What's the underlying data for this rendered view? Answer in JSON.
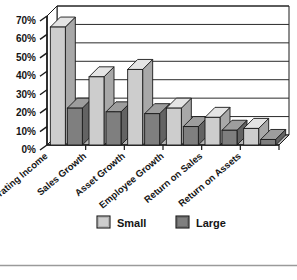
{
  "chart_data": {
    "type": "bar",
    "title": "",
    "subtitle": "",
    "xlabel": "",
    "ylabel": "",
    "categories": [
      "Operating Income",
      "Sales Growth",
      "Asset Growth",
      "Employee Growth",
      "Return on Sales",
      "Return on Assets"
    ],
    "series": [
      {
        "name": "Small",
        "color": "#cdcdcd",
        "values": [
          64,
          37,
          41,
          20,
          15,
          9
        ]
      },
      {
        "name": "Large",
        "color": "#7f7f7f",
        "values": [
          20,
          18,
          17,
          10,
          8,
          3
        ]
      }
    ],
    "ylim": [
      0,
      70
    ],
    "ytick_values": [
      0,
      10,
      20,
      30,
      40,
      50,
      60,
      70
    ],
    "ytick_labels": [
      "0%",
      "10%",
      "20%",
      "30%",
      "40%",
      "50%",
      "60%",
      "70%"
    ],
    "grid": true,
    "grid_axis": "y",
    "legend_position": "bottom",
    "legend_entries": [
      {
        "label": "Small",
        "color": "#cdcdcd"
      },
      {
        "label": "Large",
        "color": "#7f7f7f"
      }
    ],
    "style": "3d-column",
    "value_format": "percent"
  },
  "colors": {
    "small_face": "#cdcdcd",
    "small_top": "#e4e4e4",
    "small_side": "#a8a8a8",
    "large_face": "#7f7f7f",
    "large_top": "#9d9d9d",
    "large_side": "#636363",
    "axis": "#1a1a1a",
    "grid": "#2a2a2a",
    "floor": "#b5b5b5",
    "text": "#151515",
    "footer_rule": "#9a9a9a"
  },
  "footer": {
    "rule_visible": true
  }
}
